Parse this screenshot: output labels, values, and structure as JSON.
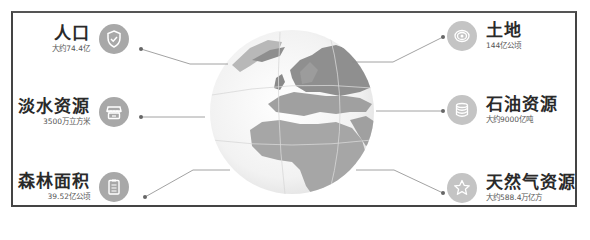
{
  "colors": {
    "frame": "#444444",
    "icon_bg": "#a8a8a8",
    "icon_bg_light": "#c4c4c4",
    "title": "#2a2a2a",
    "value": "#555555",
    "connector": "#8a8a8a",
    "globe_land": "#9a9a9a",
    "globe_sea": "#eeeeee"
  },
  "items": [
    {
      "id": "population",
      "side": "left",
      "title": "人口",
      "value": "大约74.4亿",
      "icon": "shield-check-icon"
    },
    {
      "id": "freshwater",
      "side": "left",
      "title": "淡水资源",
      "value": "3500万立方米",
      "icon": "storefront-icon"
    },
    {
      "id": "forest",
      "side": "left",
      "title": "森林面积",
      "value": "39.52亿公顷",
      "icon": "clipboard-icon"
    },
    {
      "id": "land",
      "side": "right",
      "title": "土地",
      "value": "144亿公顷",
      "icon": "target-rings-icon"
    },
    {
      "id": "oil",
      "side": "right",
      "title": "石油资源",
      "value": "大约9000亿吨",
      "icon": "database-stack-icon"
    },
    {
      "id": "gas",
      "side": "right",
      "title": "天然气资源",
      "value": "大约588.4万亿方",
      "icon": "star-icon"
    }
  ]
}
